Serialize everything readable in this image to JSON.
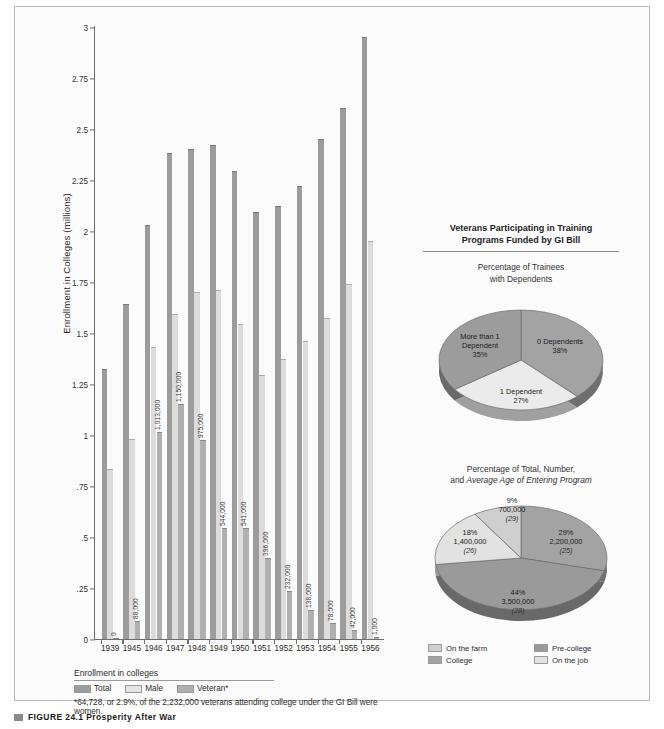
{
  "chart_data": [
    {
      "type": "bar",
      "title": "",
      "xlabel": "",
      "ylabel": "Enrollment in Colleges (millions)",
      "ylim": [
        0,
        3
      ],
      "yticks": [
        "0",
        ".25",
        ".5",
        ".75",
        "1",
        "1.25",
        "1.5",
        "1.75",
        "2",
        "2.25",
        "2.5",
        "2.75",
        "3"
      ],
      "ytick_values": [
        0,
        0.25,
        0.5,
        0.75,
        1,
        1.25,
        1.5,
        1.75,
        2,
        2.25,
        2.5,
        2.75,
        3
      ],
      "grid": false,
      "categories": [
        "1939",
        "1945",
        "1946",
        "1947",
        "1948",
        "1949",
        "1950",
        "1951",
        "1952",
        "1953",
        "1954",
        "1955",
        "1956"
      ],
      "series": [
        {
          "name": "Total",
          "color": "#9c9c9c",
          "values": [
            1.32,
            1.64,
            2.03,
            2.38,
            2.4,
            2.42,
            2.29,
            2.09,
            2.12,
            2.22,
            2.45,
            2.6,
            2.95
          ]
        },
        {
          "name": "Male",
          "color": "#dcdcdc",
          "values": [
            0.83,
            0.98,
            1.43,
            1.59,
            1.7,
            1.71,
            1.54,
            1.29,
            1.37,
            1.46,
            1.57,
            1.74,
            1.95
          ]
        },
        {
          "name": "Veteran*",
          "color": "#b0b0b0",
          "values": [
            0.0,
            0.088,
            1.013,
            1.15,
            0.975,
            0.544,
            0.541,
            0.396,
            0.232,
            0.138,
            0.078,
            0.042,
            0.001
          ]
        }
      ],
      "veteran_labels": [
        "0",
        "88,000",
        "1,013,000",
        "1,150,000",
        "975,000",
        "544,000",
        "541,000",
        "396,000",
        "232,000",
        "138,000",
        "78,000",
        "42,000",
        "1,000"
      ],
      "legend": {
        "title": "Enrollment in colleges",
        "position": "below",
        "entries": [
          "Total",
          "Male",
          "Veteran*"
        ]
      },
      "footnote": "*64,728, or 2.9%, of the 2,232,000 veterans attending college under the GI Bill were women."
    },
    {
      "type": "pie",
      "title": "Percentage of Trainees with Dependents",
      "labels": [
        "0 Dependents",
        "1 Dependent",
        "More than 1 Dependent"
      ],
      "values": [
        38,
        27,
        35
      ],
      "value_labels": [
        "38%",
        "27%",
        "35%"
      ],
      "colors": [
        "#a3a3a3",
        "#ebebeb",
        "#9c9c9c"
      ]
    },
    {
      "type": "pie",
      "title_line1": "Percentage of Total, Number,",
      "title_line2_plain": "and ",
      "title_line2_italic": "Average Age of Entering Program",
      "labels": [
        "College",
        "On the job",
        "Pre-college",
        "On the farm"
      ],
      "values": [
        29,
        44,
        18,
        9
      ],
      "percent_labels": [
        "29%",
        "44%",
        "18%",
        "9%"
      ],
      "number_labels": [
        "2,200,000",
        "3,500,000",
        "1,400,000",
        "700,000"
      ],
      "age_labels": [
        "(25)",
        "(28)",
        "(26)",
        "(29)"
      ],
      "colors": [
        "#a3a3a3",
        "#9a9a9a",
        "#e2e2e2",
        "#cfcfcf"
      ],
      "legend": {
        "entries": [
          {
            "label": "On the farm",
            "color": "#cfcfcf"
          },
          {
            "label": "Pre-college",
            "color": "#9a9a9a"
          },
          {
            "label": "College",
            "color": "#a3a3a3"
          },
          {
            "label": "On the job",
            "color": "#e2e2e2"
          }
        ]
      }
    }
  ],
  "right_panel": {
    "heading_line1": "Veterans Participating in Training",
    "heading_line2": "Programs Funded by GI Bill",
    "pie1_caption_line1": "Percentage of Trainees",
    "pie1_caption_line2": "with Dependents",
    "pie2_caption_line1": "Percentage of Total, Number,",
    "pie2_caption_line2_plain": "and ",
    "pie2_caption_line2_italic": "Average Age of Entering Program"
  },
  "caption": {
    "text": "FIGURE 24.1  Prosperity After War"
  },
  "colors": {
    "total": "#9c9c9c",
    "male": "#dcdcdc",
    "veteran": "#b0b0b0",
    "axis": "#6d6d6d",
    "page_bg": "#ffffff",
    "frame_bg": "#fbfbfb"
  }
}
